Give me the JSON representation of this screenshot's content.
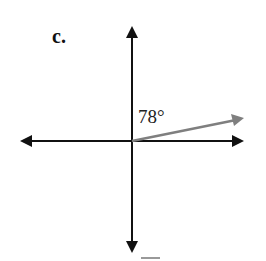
{
  "figure": {
    "label": "c.",
    "angle_text": "78°",
    "angle_degrees": 78,
    "colors": {
      "axes": "#111111",
      "ray": "#7f7f7f"
    }
  }
}
